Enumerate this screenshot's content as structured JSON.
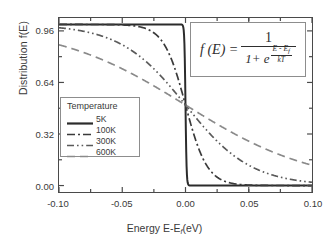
{
  "chart_data": {
    "type": "line",
    "title": "",
    "xlabel": "Energy E-E_f (eV)",
    "ylabel": "Distribution f(E)",
    "xlim": [
      -0.1,
      0.1
    ],
    "ylim": [
      -0.04,
      1.04
    ],
    "xticks": [
      "-0.10",
      "-0.05",
      "0.00",
      "0.05",
      "0.10"
    ],
    "xtick_values": [
      -0.1,
      -0.05,
      0.0,
      0.05,
      0.1
    ],
    "yticks": [
      "0.00",
      "0.32",
      "0.64",
      "0.96"
    ],
    "ytick_values": [
      0.0,
      0.32,
      0.64,
      0.96
    ],
    "grid": false,
    "legend_position": "center-left",
    "legend_title": "Temperature",
    "x": [
      -0.1,
      -0.09,
      -0.08,
      -0.07,
      -0.06,
      -0.05,
      -0.04,
      -0.03,
      -0.02,
      -0.01,
      -0.005,
      0.0,
      0.005,
      0.01,
      0.02,
      0.03,
      0.04,
      0.05,
      0.06,
      0.07,
      0.08,
      0.09,
      0.1
    ],
    "series": [
      {
        "name": "5K",
        "temperature_K": 5,
        "style": "solid",
        "color": "#2b2b2b",
        "values": [
          1.0,
          1.0,
          1.0,
          1.0,
          1.0,
          1.0,
          1.0,
          1.0,
          1.0,
          1.0,
          1.0,
          0.5,
          0.0,
          0.0,
          0.0,
          0.0,
          0.0,
          0.0,
          0.0,
          0.0,
          0.0,
          0.0,
          0.0
        ]
      },
      {
        "name": "100K",
        "temperature_K": 100,
        "style": "dash-dot",
        "color": "#3a3a3a",
        "values": [
          1.0,
          1.0,
          0.999,
          0.999,
          0.999,
          0.997,
          0.99,
          0.969,
          0.909,
          0.76,
          0.64,
          0.5,
          0.36,
          0.24,
          0.091,
          0.031,
          0.01,
          0.003,
          0.001,
          0.001,
          0.001,
          0.0,
          0.0
        ]
      },
      {
        "name": "300K",
        "temperature_K": 300,
        "style": "dash-dot-dot",
        "color": "#5a5a5a",
        "values": [
          0.98,
          0.97,
          0.956,
          0.937,
          0.91,
          0.876,
          0.827,
          0.762,
          0.681,
          0.596,
          0.548,
          0.5,
          0.452,
          0.404,
          0.319,
          0.238,
          0.173,
          0.124,
          0.09,
          0.063,
          0.044,
          0.03,
          0.021
        ]
      },
      {
        "name": "600K",
        "temperature_K": 600,
        "style": "dashed",
        "color": "#8a8a8a",
        "values": [
          0.875,
          0.861,
          0.846,
          0.829,
          0.81,
          0.789,
          0.765,
          0.739,
          0.711,
          0.681,
          0.665,
          0.5,
          0.524,
          0.452,
          0.389,
          0.322,
          0.261,
          0.211,
          0.17,
          0.139,
          0.11,
          0.086,
          0.07
        ]
      }
    ]
  },
  "axes": {
    "y_title": "Distribution f(E)",
    "x_title_pre": "Energy E-E",
    "x_title_sub": "f",
    "x_title_post": "(eV)"
  },
  "legend": {
    "title": "Temperature",
    "items": [
      {
        "label": "5K"
      },
      {
        "label": "100K"
      },
      {
        "label": "300K"
      },
      {
        "label": "600K"
      }
    ]
  },
  "formula": {
    "lhs": "f (E) =",
    "numerator": "1",
    "denominator_base": "1+ e",
    "exponent_numerator": "E - E",
    "exponent_numerator_sub": "f",
    "exponent_denominator": "kT",
    "plain_text": "f(E) = 1 / (1 + e^((E-Ef)/kT))"
  },
  "colors": {
    "background": "#ffffff",
    "frame": "#4a4a4a",
    "text": "#3a3a3a",
    "box_border": "#8d8d8d"
  }
}
